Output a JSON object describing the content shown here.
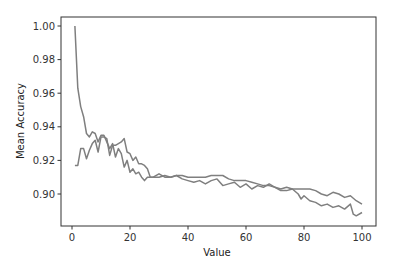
{
  "chart_data": {
    "type": "line",
    "title": "",
    "xlabel": "Value",
    "ylabel": "Mean Accuracy",
    "xlim": [
      -4,
      105
    ],
    "ylim": [
      0.881,
      1.005
    ],
    "xticks": [
      0,
      20,
      40,
      60,
      80,
      100
    ],
    "xtick_labels": [
      "0",
      "20",
      "40",
      "60",
      "80",
      "100"
    ],
    "yticks": [
      0.9,
      0.92,
      0.94,
      0.96,
      0.98,
      1.0
    ],
    "ytick_labels": [
      "0.90",
      "0.92",
      "0.94",
      "0.96",
      "0.98",
      "1.00"
    ],
    "grid": false,
    "legend": null,
    "series": [
      {
        "name": "series-1",
        "color": "#7f7f7f",
        "x": [
          1,
          2,
          3,
          4,
          5,
          6,
          7,
          8,
          9,
          10,
          11,
          12,
          13,
          14,
          15,
          16,
          17,
          18,
          19,
          20,
          21,
          22,
          23,
          24,
          25,
          26,
          27,
          28,
          30,
          32,
          34,
          36,
          38,
          40,
          42,
          44,
          46,
          48,
          50,
          52,
          54,
          56,
          58,
          60,
          62,
          64,
          66,
          68,
          70,
          72,
          74,
          76,
          78,
          79,
          80,
          82,
          84,
          86,
          88,
          90,
          92,
          94,
          96,
          97,
          98,
          100
        ],
        "values": [
          1.0,
          0.963,
          0.952,
          0.946,
          0.936,
          0.934,
          0.937,
          0.936,
          0.931,
          0.935,
          0.935,
          0.931,
          0.927,
          0.93,
          0.922,
          0.927,
          0.924,
          0.916,
          0.92,
          0.913,
          0.915,
          0.912,
          0.913,
          0.91,
          0.908,
          0.91,
          0.91,
          0.91,
          0.91,
          0.911,
          0.91,
          0.911,
          0.909,
          0.908,
          0.907,
          0.908,
          0.906,
          0.908,
          0.909,
          0.905,
          0.906,
          0.907,
          0.904,
          0.906,
          0.903,
          0.905,
          0.904,
          0.906,
          0.904,
          0.903,
          0.904,
          0.903,
          0.9,
          0.897,
          0.899,
          0.896,
          0.895,
          0.893,
          0.894,
          0.892,
          0.893,
          0.891,
          0.894,
          0.888,
          0.887,
          0.889
        ]
      },
      {
        "name": "series-2",
        "color": "#7f7f7f",
        "x": [
          1,
          2,
          3,
          4,
          5,
          6,
          7,
          8,
          9,
          10,
          11,
          12,
          13,
          14,
          15,
          16,
          17,
          18,
          19,
          20,
          21,
          22,
          23,
          24,
          25,
          26,
          27,
          28,
          30,
          32,
          34,
          36,
          38,
          40,
          42,
          44,
          46,
          48,
          50,
          52,
          54,
          56,
          58,
          60,
          62,
          64,
          66,
          68,
          70,
          72,
          74,
          76,
          78,
          80,
          82,
          84,
          86,
          88,
          90,
          92,
          94,
          96,
          98,
          100
        ],
        "values": [
          0.917,
          0.917,
          0.927,
          0.927,
          0.921,
          0.926,
          0.93,
          0.932,
          0.925,
          0.934,
          0.934,
          0.933,
          0.923,
          0.929,
          0.929,
          0.93,
          0.931,
          0.933,
          0.925,
          0.924,
          0.92,
          0.922,
          0.918,
          0.918,
          0.917,
          0.915,
          0.91,
          0.91,
          0.912,
          0.91,
          0.91,
          0.911,
          0.911,
          0.91,
          0.91,
          0.91,
          0.91,
          0.911,
          0.911,
          0.911,
          0.909,
          0.908,
          0.908,
          0.908,
          0.907,
          0.906,
          0.905,
          0.905,
          0.904,
          0.902,
          0.902,
          0.903,
          0.903,
          0.903,
          0.903,
          0.902,
          0.9,
          0.899,
          0.901,
          0.9,
          0.898,
          0.899,
          0.896,
          0.894
        ]
      }
    ]
  },
  "axes": {
    "xlabel": "Value",
    "ylabel": "Mean Accuracy"
  }
}
